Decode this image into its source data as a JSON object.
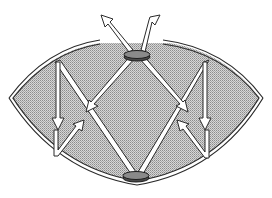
{
  "diagram": {
    "title": "Lens-shaped cavity with two disc elements and reflected beams",
    "colors": {
      "background": "#ffffff",
      "cavity_fill": "#bdbdbd",
      "outline": "#2a2a2a",
      "beam_fill": "#ffffff",
      "disc_fill": "#8a8a8a"
    },
    "elements": {
      "cavity": "lens-shaped shaded region with double-line wall, open at top",
      "top_disc": "elliptical disc at top opening",
      "bottom_disc": "elliptical disc at bottom wall",
      "beams": [
        "top disc to lower-left (arrow)",
        "top disc to lower-right (arrow)",
        "upper-left to bottom disc",
        "bottom disc to upper-right",
        "left vertical downward arrow",
        "left upward-right return arrow",
        "right vertical downward arrow",
        "right upward-left return arrow",
        "exit arrow up-left",
        "exit arrow up-right"
      ]
    }
  }
}
